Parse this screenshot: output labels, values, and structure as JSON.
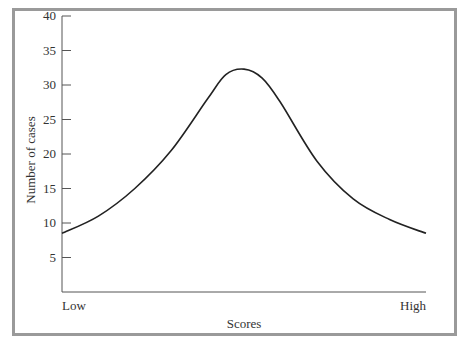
{
  "chart_data": {
    "type": "line",
    "title": "",
    "xlabel": "Scores",
    "ylabel": "Number of cases",
    "x_tick_labels": [
      "Low",
      "High"
    ],
    "y_ticks": [
      5,
      10,
      15,
      20,
      25,
      30,
      35,
      40
    ],
    "ylim": [
      0,
      40
    ],
    "grid": false,
    "legend": null,
    "series": [
      {
        "name": "Distribution",
        "x": [
          0,
          0.1,
          0.2,
          0.3,
          0.4,
          0.45,
          0.5,
          0.55,
          0.6,
          0.7,
          0.8,
          0.9,
          1.0
        ],
        "values": [
          8.5,
          11,
          15,
          20.5,
          28,
          31.5,
          32.3,
          31,
          27.5,
          19,
          13.5,
          10.5,
          8.5
        ]
      }
    ]
  }
}
